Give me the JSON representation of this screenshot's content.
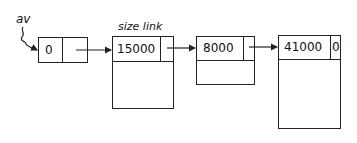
{
  "diagram": {
    "type": "linked-list-free-blocks",
    "pointer_label": "av",
    "field_labels": {
      "size": "size",
      "link": "link",
      "combined": "size link"
    },
    "nodes": [
      {
        "size": "0",
        "link": "",
        "has_body": false
      },
      {
        "size": "15000",
        "link": "",
        "has_body": true
      },
      {
        "size": "8000",
        "link": "",
        "has_body": true
      },
      {
        "size": "41000",
        "link": "0",
        "has_body": true
      }
    ],
    "edges": [
      {
        "from": "av",
        "to": "node-0"
      },
      {
        "from": "node-0",
        "to": "node-1"
      },
      {
        "from": "node-1",
        "to": "node-2"
      },
      {
        "from": "node-2",
        "to": "node-3"
      }
    ],
    "colors": {
      "line": "#222222",
      "background": "#ffffff"
    }
  }
}
